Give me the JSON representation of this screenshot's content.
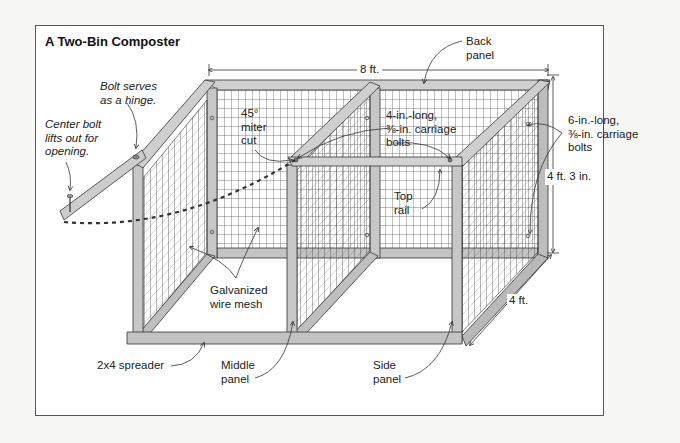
{
  "title": "A Two-Bin Composter",
  "colors": {
    "background": "#f7f7f5",
    "panel": "#ffffff",
    "border": "#555555",
    "wood": "#c9c9c9",
    "wood_dark": "#9a9a9a",
    "outline": "#333333",
    "mesh": "#444444"
  },
  "labels": {
    "back_panel": "Back\npanel",
    "bolt_hinge": "Bolt serves\nas a hinge.",
    "center_bolt": "Center bolt\nlifts out for\nopening.",
    "miter_cut": "45°\nmiter\ncut",
    "carriage_bolts_4in": "4-in.-long,\n⅜-in. carriage\nbolts",
    "carriage_bolts_6in": "6-in.-long,\n⅜-in. carriage\nbolts",
    "top_rail": "Top\nrail",
    "wire_mesh": "Galvanized\nwire mesh",
    "spreader": "2x4 spreader",
    "middle_panel": "Middle\npanel",
    "side_panel": "Side\npanel"
  },
  "dimensions": {
    "width": "8 ft.",
    "height": "4 ft. 3 in.",
    "depth": "4 ft."
  }
}
